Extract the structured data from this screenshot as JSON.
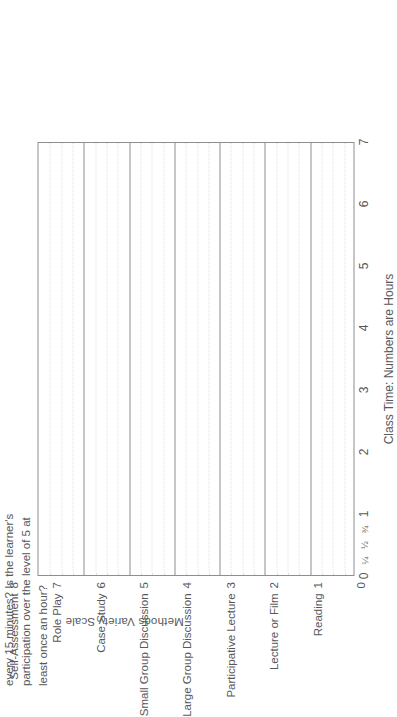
{
  "chart_data": {
    "type": "table",
    "title": "Methods Variety Scale",
    "xlabel": "Class Time: Numbers are Hours",
    "ylabel": "Methods Variety Scale",
    "xlim": [
      0,
      7
    ],
    "ylim": [
      0,
      10
    ],
    "grid": true,
    "legend": null,
    "series": [],
    "x_major_ticks": [
      "0",
      "1",
      "2",
      "3",
      "4",
      "5",
      "6",
      "7"
    ],
    "x_minor_ticks": [
      "¼",
      "½",
      "¾"
    ],
    "x_minor_values": [
      0.25,
      0.5,
      0.75
    ],
    "y_ticks": [
      {
        "value": 10,
        "label": "Structured Experience"
      },
      {
        "value": 9,
        "label": "Return Demonstration"
      },
      {
        "value": 8,
        "label": "Self-Assessment"
      },
      {
        "value": 7,
        "label": "Role Play"
      },
      {
        "value": 6,
        "label": "Case Study"
      },
      {
        "value": 5,
        "label": "Small Group Discussion"
      },
      {
        "value": 4,
        "label": "Large Group Discussion"
      },
      {
        "value": 3,
        "label": "Participative Lecture"
      },
      {
        "value": 2,
        "label": "Lecture or Film"
      },
      {
        "value": 1,
        "label": "Reading"
      },
      {
        "value": 0,
        "label": ""
      }
    ],
    "annotation_lines": [
      "every 15 minutes? Is the learner's",
      "participation over the level of 5 at",
      "least once an hour?"
    ],
    "gridline_color": "#8e8e8e",
    "minor_gridline_color": "#dedede",
    "text_color": "#58585a",
    "background": "#ffffff"
  }
}
